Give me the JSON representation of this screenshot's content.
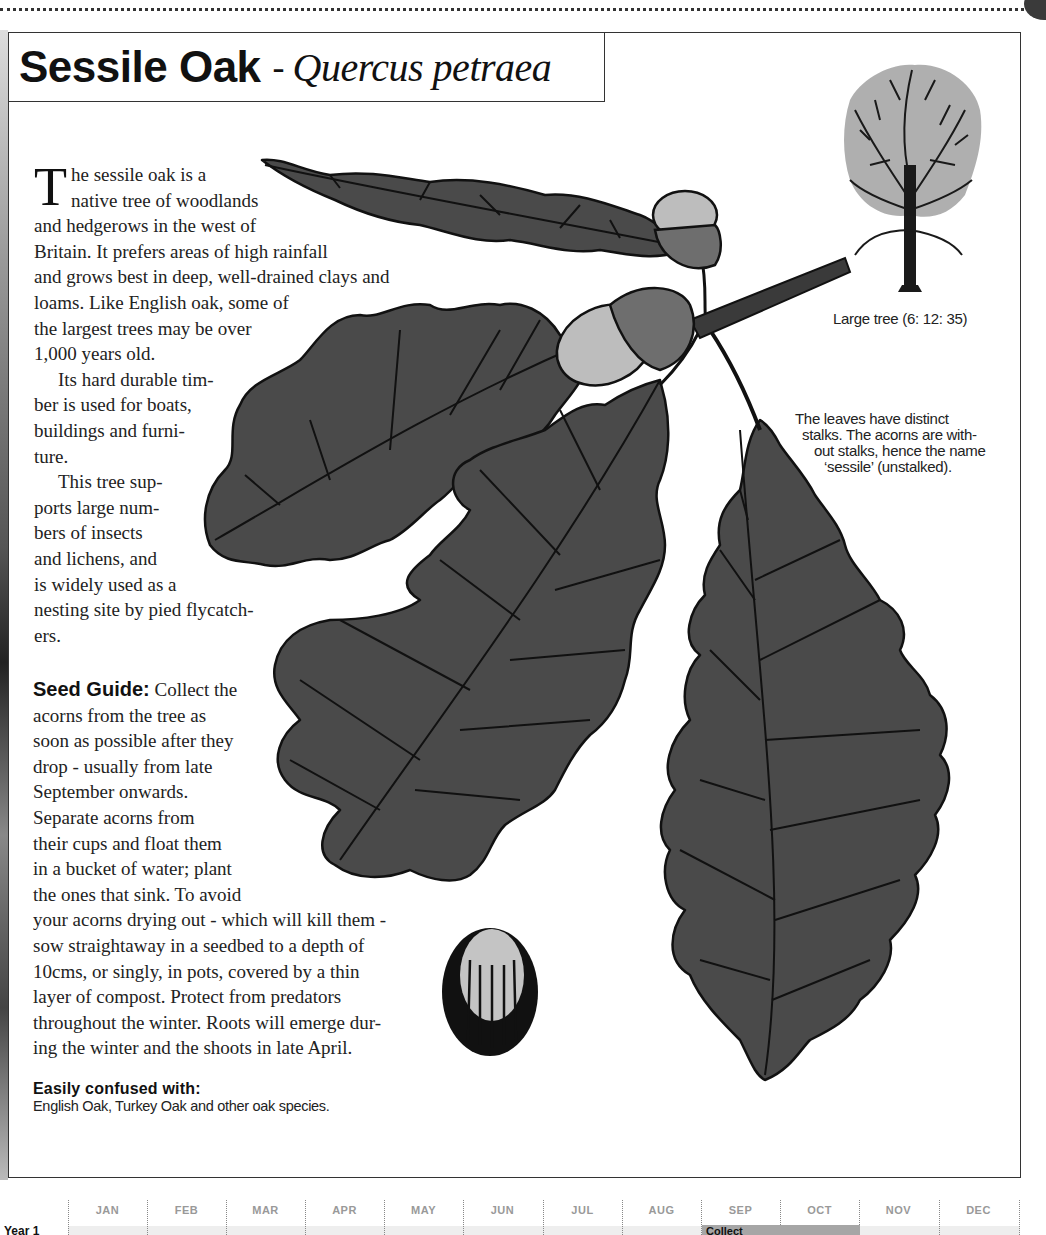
{
  "page": {
    "title_common": "Sessile Oak",
    "title_separator": "-",
    "title_latin": "Quercus petraea"
  },
  "intro": {
    "dropcap": "T",
    "lines": [
      "he sessile oak is a",
      "native tree of woodlands",
      "and hedgerows in the west of",
      "Britain. It prefers areas of high rainfall",
      "and grows best in deep, well-drained clays and",
      "loams. Like English oak, some of",
      "the largest trees may be over",
      "1,000 years old."
    ],
    "timber_lines": [
      "Its hard durable tim-",
      "ber is used for boats,",
      "buildings and furni-",
      "ture."
    ],
    "wildlife_lines": [
      "This tree sup-",
      "ports large num-",
      "bers of insects",
      "and lichens, and",
      "is widely used as a",
      "nesting site by pied flycatch-",
      "ers."
    ]
  },
  "seed_guide": {
    "heading": "Seed Guide:",
    "first_line": " Collect the",
    "lines": [
      "acorns  from the tree as",
      "soon as possible after they",
      "drop  - usually from late",
      "September onwards.",
      "Separate acorns from",
      "their cups and float them",
      "in a bucket of water; plant",
      "the ones that sink. To avoid",
      "your acorns drying out - which will kill them -",
      "sow straightaway in a seedbed to a depth of",
      "10cms, or singly, in pots, covered by a thin",
      "layer of compost. Protect from predators",
      "throughout the winter. Roots will emerge dur-",
      "ing the winter and the shoots in late April."
    ]
  },
  "confused_with": {
    "heading": "Easily confused with:",
    "value": "English Oak, Turkey Oak and other oak species."
  },
  "tree_caption": "Large tree (6: 12: 35)",
  "leaf_caption": {
    "lines": [
      "The leaves have distinct",
      "stalks. The acorns are with-",
      "out stalks, hence the name",
      "‘sessile’ (unstalked)."
    ]
  },
  "illustrations": {
    "tree_silhouette": "tree-icon",
    "oak_sprig": "oak-leaves-acorns-illustration",
    "single_acorn": "acorn-icon",
    "leaf_fill": "#4a4a4a",
    "outline": "#111111"
  },
  "calendar": {
    "months": [
      "JAN",
      "FEB",
      "MAR",
      "APR",
      "MAY",
      "JUN",
      "JUL",
      "AUG",
      "SEP",
      "OCT",
      "NOV",
      "DEC"
    ],
    "rows": [
      {
        "label": "Year 1",
        "bars": [
          {
            "label": "Collect",
            "start_month": "SEP",
            "end_month": "OCT",
            "color": "#a6a6a6"
          }
        ]
      }
    ],
    "month_color": "#999999"
  }
}
